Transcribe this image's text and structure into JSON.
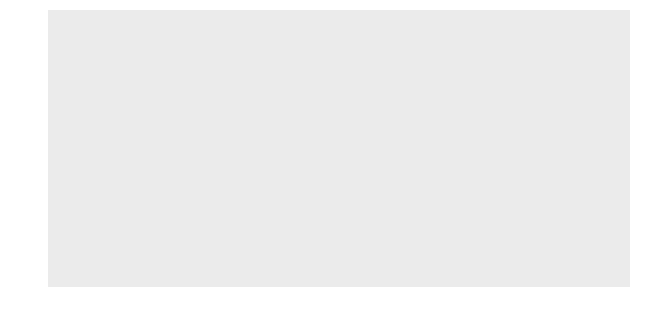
{
  "chart_data": {
    "type": "bar",
    "title": "",
    "xlabel": "",
    "ylabel": "Millions of Tons",
    "stacked": true,
    "grid": true,
    "legend_position": "none",
    "xlim": [
      1869.3,
      1900.7
    ],
    "ylim": [
      0,
      30
    ],
    "ytick_labels": [
      "0",
      "5",
      "10",
      "15",
      "20",
      "25",
      "30"
    ],
    "ytick_values": [
      0,
      5,
      10,
      15,
      20,
      25,
      30
    ],
    "xtick_labels": [
      "1870",
      "1875",
      "1880",
      "1885",
      "1890",
      "1895",
      "1900"
    ],
    "xtick_values": [
      1870,
      1875,
      1880,
      1885,
      1890,
      1895,
      1900
    ],
    "categories": [
      1870,
      1871,
      1872,
      1873,
      1874,
      1875,
      1876,
      1877,
      1878,
      1879,
      1880,
      1881,
      1882,
      1883,
      1884,
      1885,
      1886,
      1887,
      1888,
      1889,
      1890,
      1891,
      1892,
      1893,
      1894,
      1895,
      1896,
      1897,
      1898,
      1899,
      1900
    ],
    "series": [
      {
        "name": "Pig Iron",
        "color": "#585858",
        "values": [
          2.1,
          2.2,
          2.8,
          3.1,
          2.8,
          2.5,
          2.4,
          2.6,
          3.0,
          3.9,
          5.4,
          6.4,
          6.5,
          6.2,
          5.0,
          4.6,
          6.3,
          7.8,
          7.5,
          8.6,
          10.3,
          10.0,
          10.2,
          7.8,
          7.4,
          10.5,
          9.8,
          10.6,
          13.0,
          15.3,
          15.4
        ]
      },
      {
        "name": "Steel",
        "color": "#5d5d5d",
        "values": [
          0.2,
          0.3,
          0.4,
          0.4,
          0.4,
          0.5,
          0.7,
          0.8,
          0.9,
          1.1,
          1.4,
          1.6,
          1.8,
          1.2,
          1.6,
          1.8,
          3.1,
          3.5,
          3.0,
          3.0,
          5.4,
          4.0,
          6.0,
          4.6,
          4.8,
          7.0,
          6.2,
          7.0,
          5.6,
          12.2,
          11.8
        ]
      }
    ],
    "totals": [
      2.3,
      2.5,
      3.2,
      3.5,
      3.2,
      3.0,
      3.1,
      3.4,
      3.9,
      5.0,
      6.8,
      8.0,
      8.3,
      7.4,
      6.6,
      6.4,
      9.4,
      11.3,
      10.5,
      11.6,
      15.7,
      14.0,
      16.2,
      12.4,
      12.2,
      17.5,
      16.0,
      17.6,
      18.6,
      27.5,
      27.2
    ],
    "annotations": [
      {
        "id": "pig-iron",
        "text": "Pig Iron",
        "label_x": 284,
        "label_y": 147,
        "line": {
          "x1": 305,
          "y1": 156,
          "x2": 349,
          "y2": 226
        }
      },
      {
        "id": "steel",
        "text": "Steel",
        "label_x": 363,
        "label_y": 147,
        "line": {
          "x1": 372,
          "y1": 156,
          "x2": 352,
          "y2": 206
        }
      }
    ],
    "colors": {
      "panel_background": "#ebebeb",
      "grid_major": "#ffffff",
      "grid_minor": "#f6f6f6",
      "bar_outline": "#262626",
      "text": "#1a1a1a",
      "page_background": "#ffffff"
    }
  }
}
